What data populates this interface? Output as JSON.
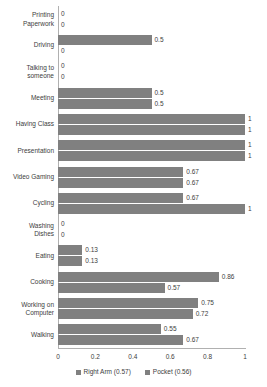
{
  "chart_data": {
    "type": "bar",
    "orientation": "horizontal",
    "title": "",
    "xlabel": "",
    "ylabel": "",
    "xlim": [
      0,
      1
    ],
    "xticks": [
      "0",
      "0.2",
      "0.4",
      "0.6",
      "0.8",
      "1"
    ],
    "grid": false,
    "legend_position": "bottom",
    "categories": [
      "Printing Paperwork",
      "Driving",
      "Talking to someone",
      "Meeting",
      "Having Class",
      "Presentation",
      "Video Gaming",
      "Cycling",
      "Washing Dishes",
      "Eating",
      "Cooking",
      "Working on Computer",
      "Walking"
    ],
    "category_lines": [
      [
        "Printing",
        "Paperwork"
      ],
      [
        "Driving"
      ],
      [
        "Talking to",
        "someone"
      ],
      [
        "Meeting"
      ],
      [
        "Having Class"
      ],
      [
        "Presentation"
      ],
      [
        "Video Gaming"
      ],
      [
        "Cycling"
      ],
      [
        "Washing",
        "Dishes"
      ],
      [
        "Eating"
      ],
      [
        "Cooking"
      ],
      [
        "Working on",
        "Computer"
      ],
      [
        "Walking"
      ]
    ],
    "series": [
      {
        "name": "Right Arm (0.57)",
        "color": "#808080",
        "values": [
          0,
          0.5,
          0,
          0.5,
          1,
          1,
          0.67,
          0.67,
          0,
          0.13,
          0.86,
          0.75,
          0.55
        ],
        "labels": [
          "0",
          "0.5",
          "0",
          "0.5",
          "1",
          "1",
          "0.67",
          "0.67",
          "0",
          "0.13",
          "0.86",
          "0.75",
          "0.55"
        ]
      },
      {
        "name": "Pocket (0.56)",
        "color": "#808080",
        "values": [
          0,
          0,
          0,
          0.5,
          1,
          1,
          0.67,
          1,
          0,
          0.13,
          0.57,
          0.72,
          0.67
        ],
        "labels": [
          "0",
          "0",
          "0",
          "0.5",
          "1",
          "1",
          "0.67",
          "1",
          "0",
          "0.13",
          "0.57",
          "0.72",
          "0.67"
        ]
      }
    ]
  },
  "legend": {
    "items": [
      {
        "label": "Right Arm (0.57)",
        "color": "#808080"
      },
      {
        "label": "Pocket (0.56)",
        "color": "#808080"
      }
    ]
  }
}
